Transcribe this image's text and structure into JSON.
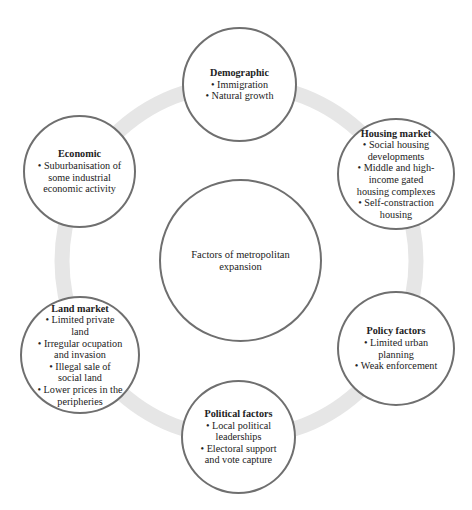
{
  "diagram": {
    "ring_color": "#e6e6e6",
    "border_color": "#6f6f6f",
    "center": {
      "label_line1": "Factors of metropolitan",
      "label_line2": "expansion"
    },
    "nodes": {
      "demographic": {
        "title": "Demographic",
        "items": [
          "Immigration",
          "Natural growth"
        ]
      },
      "housing": {
        "title": "Housing market",
        "items": [
          "Social housing developments",
          "Middle and high-income gated housing complexes",
          "Self-constraction housing"
        ]
      },
      "policy": {
        "title": "Policy factors",
        "items": [
          "Limited urban planning",
          "Weak enforcement"
        ]
      },
      "political": {
        "title": "Political factors",
        "items": [
          "Local political leaderships",
          "Electoral support and vote capture"
        ]
      },
      "land": {
        "title": "Land market",
        "items": [
          "Limited private land",
          "Irregular ocupation and invasion",
          "Illegal sale of social land",
          "Lower prices in the peripheries"
        ]
      },
      "economic": {
        "title": "Economic",
        "items": [
          "Suburbanisation of some industrial economic activity"
        ]
      }
    }
  }
}
